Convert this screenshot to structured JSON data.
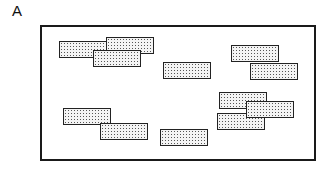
{
  "panel": {
    "label": "A"
  },
  "diagram": {
    "frame": {
      "x": 40,
      "y": 25,
      "width": 272,
      "height": 132
    },
    "block_size": {
      "width": 48,
      "height": 17
    },
    "blocks": [
      {
        "x": 59,
        "y": 41
      },
      {
        "x": 106,
        "y": 37
      },
      {
        "x": 93,
        "y": 50
      },
      {
        "x": 163,
        "y": 62
      },
      {
        "x": 231,
        "y": 45
      },
      {
        "x": 250,
        "y": 63
      },
      {
        "x": 63,
        "y": 108
      },
      {
        "x": 100,
        "y": 123
      },
      {
        "x": 160,
        "y": 129
      },
      {
        "x": 219,
        "y": 92
      },
      {
        "x": 217,
        "y": 113
      },
      {
        "x": 246,
        "y": 101
      }
    ],
    "colors": {
      "border": "#222222",
      "fill": "#f4f4f4",
      "dots": "#555555"
    }
  }
}
